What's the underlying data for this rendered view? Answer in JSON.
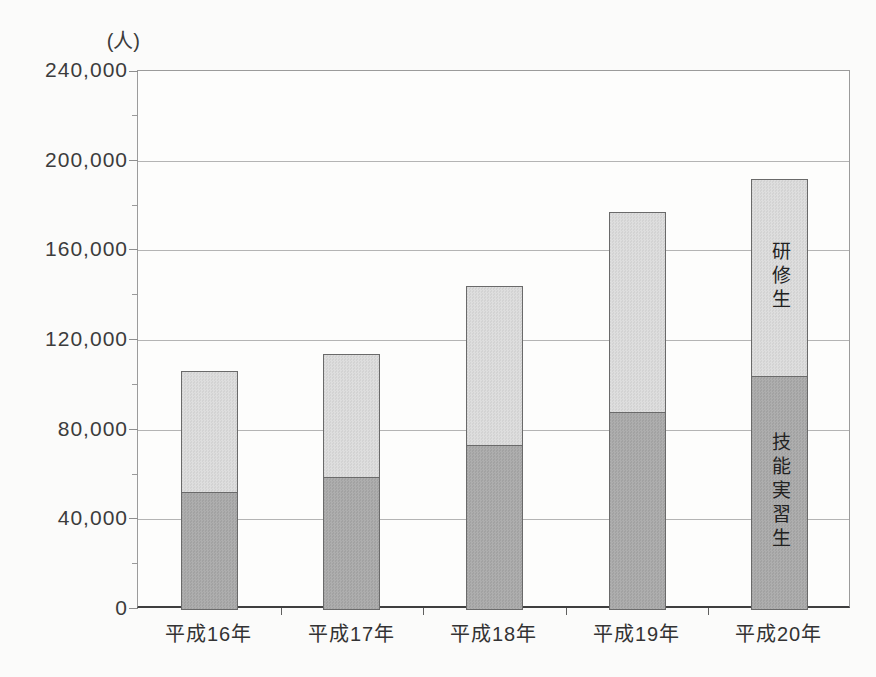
{
  "chart_data": {
    "type": "bar",
    "stacked": true,
    "unit_label": "(人)",
    "categories": [
      "平成16年",
      "平成17年",
      "平成18年",
      "平成19年",
      "平成20年"
    ],
    "series": [
      {
        "name": "技能実習生",
        "values": [
          52000,
          59000,
          73000,
          88000,
          104000
        ],
        "color": "#a8a8a8"
      },
      {
        "name": "研修生",
        "values": [
          54000,
          55000,
          71000,
          89000,
          88000
        ],
        "color": "#d9d9d9"
      }
    ],
    "totals": [
      106000,
      114000,
      144000,
      177000,
      192000
    ],
    "ylim": [
      0,
      240000
    ],
    "ytick_step": 40000,
    "ytick_labels": [
      "0",
      "40,000",
      "80,000",
      "120,000",
      "160,000",
      "200,000",
      "240,000"
    ],
    "minor_tick_step": 20000,
    "grid": true,
    "legend_position": "labels-inside-last-bar",
    "annotations": [
      {
        "text": "研修生",
        "category_index": 4,
        "series_index": 1
      },
      {
        "text": "技能実習生",
        "category_index": 4,
        "series_index": 0
      }
    ]
  }
}
